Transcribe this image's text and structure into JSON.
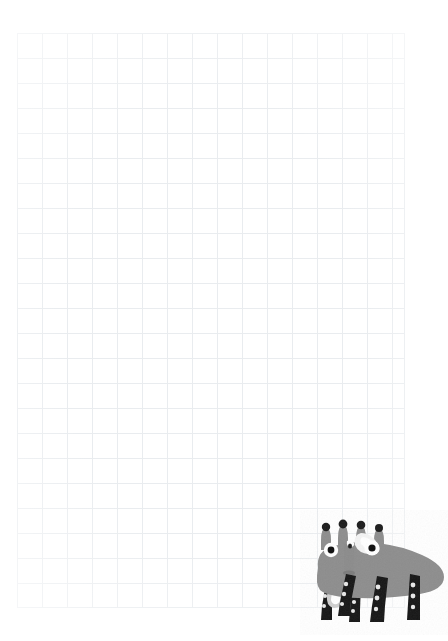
{
  "page": {
    "width": 448,
    "height": 641,
    "background_color": "#ffffff"
  },
  "grid": {
    "name": "graph-paper-grid",
    "line_color": "#e9ecef",
    "cell_size_px": 25,
    "columns": 16,
    "rows": 23,
    "left_px": 17,
    "top_px": 33,
    "width_px": 388,
    "height_px": 575
  },
  "creature": {
    "name": "gray-cartoon-animal",
    "description": "Gray four-legged cartoon creature with four spikes on its head, two white eyes with black pupils, a white triangular ear patch, a vertical snout, and dark spotted legs",
    "body_color": "#8d8d8d",
    "body_shadow_color": "#787878",
    "spike_color": "#8d8d8d",
    "spike_tip_color": "#1b1b1b",
    "eye_white_color": "#ffffff",
    "eye_pupil_color": "#111111",
    "ear_patch_color": "#f2f2f2",
    "leg_color": "#151515",
    "leg_spot_color": "#e8e8e8",
    "left_px": 300,
    "top_px": 510,
    "width_px": 148,
    "height_px": 125,
    "spike_count": 4,
    "leg_count": 4,
    "eye_count": 2
  }
}
